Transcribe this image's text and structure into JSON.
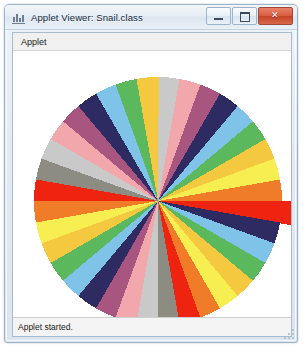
{
  "window": {
    "title": "Applet Viewer: Snail.class",
    "title_icon": "applet-viewer-icon",
    "controls": {
      "minimize_label": "–",
      "maximize_label": "□",
      "close_label": "✕"
    }
  },
  "menubar": {
    "items": [
      {
        "label": "Applet",
        "name": "menu-applet"
      }
    ]
  },
  "statusbar": {
    "text": "Applet started."
  },
  "applet": {
    "name": "Snail",
    "canvas": {
      "width": 278,
      "height": 268
    },
    "background": "#FFFFFF",
    "chart_data": {
      "type": "pie",
      "title": "Snail",
      "xlabel": "",
      "ylabel": "",
      "center": {
        "x": 145,
        "y": 150
      },
      "base_radius": 124,
      "start_angle_deg": -90,
      "wedge_count": 36,
      "sweep_deg": 10,
      "categories": [
        "w01",
        "w02",
        "w03",
        "w04",
        "w05",
        "w06",
        "w07",
        "w08",
        "w09",
        "w10",
        "w11",
        "w12",
        "w13",
        "w14",
        "w15",
        "w16",
        "w17",
        "w18",
        "w19",
        "w20",
        "w21",
        "w22",
        "w23",
        "w24",
        "w25",
        "w26",
        "w27",
        "w28",
        "w29",
        "w30",
        "w31",
        "w32",
        "w33",
        "w34",
        "w35",
        "w36"
      ],
      "values": [
        10,
        10,
        10,
        10,
        10,
        10,
        10,
        10,
        10,
        10,
        10,
        10,
        10,
        10,
        10,
        10,
        10,
        10,
        10,
        10,
        10,
        10,
        10,
        10,
        10,
        10,
        10,
        10,
        10,
        10,
        10,
        10,
        10,
        10,
        10,
        10
      ],
      "radii": [
        124,
        124,
        124,
        124,
        124,
        124,
        124,
        124,
        124,
        162,
        124,
        124,
        124,
        124,
        124,
        124,
        124,
        124,
        124,
        124,
        124,
        124,
        124,
        124,
        124,
        124,
        124,
        124,
        124,
        124,
        124,
        124,
        124,
        124,
        124,
        124
      ],
      "colors": [
        "#C9C9C9",
        "#F2A7AC",
        "#A8557F",
        "#2E2A62",
        "#7FC4E8",
        "#5CB85C",
        "#F5C93F",
        "#F7EE52",
        "#F07C2A",
        "#EE2310",
        "#2E2A62",
        "#7FC4E8",
        "#5CB85C",
        "#F5C93F",
        "#F7EE52",
        "#F07C2A",
        "#EE2310",
        "#8C8C82",
        "#C9C9C9",
        "#F2A7AC",
        "#A8557F",
        "#2E2A62",
        "#7FC4E8",
        "#5CB85C",
        "#F5C93F",
        "#F7EE52",
        "#F07C2A",
        "#EE2310",
        "#8C8C82",
        "#C9C9C9",
        "#F2A7AC",
        "#A8557F",
        "#2E2A62",
        "#7FC4E8",
        "#5CB85C",
        "#F5C93F"
      ],
      "legend": [],
      "grid": false
    }
  }
}
